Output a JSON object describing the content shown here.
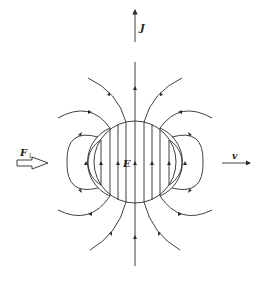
{
  "diagram": {
    "title": "",
    "labels": {
      "current_density": "J",
      "electric_field": "E",
      "lorentz_force": "F",
      "lorentz_force_subscript": "L",
      "velocity": "v"
    },
    "colors": {
      "line": "#2b2b2b",
      "background": "#ffffff"
    }
  }
}
